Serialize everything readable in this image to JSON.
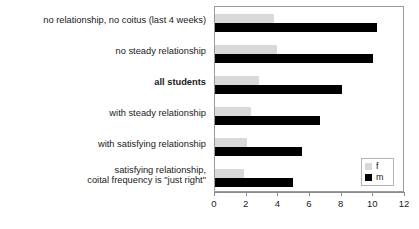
{
  "chart_data": {
    "type": "bar",
    "orientation": "horizontal",
    "title": "",
    "xlabel": "",
    "ylabel": "",
    "xlim": [
      0,
      12
    ],
    "xticks": [
      0,
      2,
      4,
      6,
      8,
      10,
      12
    ],
    "xtick_labels": [
      "0",
      "2",
      "4",
      "6",
      "8",
      "10",
      "12"
    ],
    "grid": false,
    "legend_position": "bottom-right",
    "categories": [
      "no relationship, no coitus (last 4 weeks)",
      "no steady relationship",
      "all students",
      "with steady relationship",
      "with satisfying relationship",
      "satisfying relationship, coital frequency is \"just right\""
    ],
    "category_lines": [
      [
        "no relationship, no coitus (last 4 weeks)"
      ],
      [
        "no steady relationship"
      ],
      [
        "all students"
      ],
      [
        "with steady relationship"
      ],
      [
        "with satisfying relationship"
      ],
      [
        "satisfying relationship,",
        "coital frequency is \"just right\""
      ]
    ],
    "emphasized_category": "all students",
    "series": [
      {
        "name": "f",
        "color": "#d9d9d9",
        "values": [
          3.7,
          3.9,
          2.8,
          2.3,
          2.0,
          1.8
        ]
      },
      {
        "name": "m",
        "color": "#000000",
        "values": [
          10.2,
          10.0,
          8.0,
          6.6,
          5.5,
          4.9
        ]
      }
    ],
    "legend": [
      {
        "label": "f",
        "color": "#d9d9d9"
      },
      {
        "label": "m",
        "color": "#000000"
      }
    ]
  },
  "colors": {
    "female": "#d9d9d9",
    "male": "#000000",
    "frame": "#9a9a9a",
    "axis": "#8c8c8c",
    "text": "#1a1a1a",
    "background": "#ffffff"
  }
}
